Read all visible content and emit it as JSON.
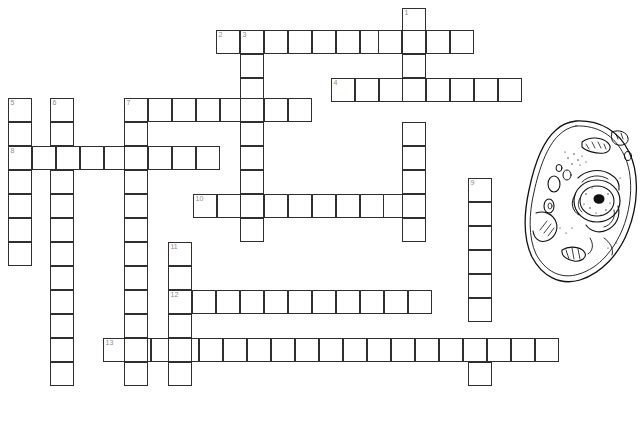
{
  "page": {
    "background_color": "#ffffff",
    "grid_line_color": "#2f2f2f",
    "number_color": "#8d8d8d",
    "cell_size_px": 24,
    "width_px": 643,
    "height_px": 422
  },
  "illustration": {
    "name": "animal-cell-diagram",
    "caption": "",
    "description": "Black and white line drawing of an animal cell showing nucleus, nucleolus, golgi apparatus, mitochondria, vacuoles and cytoplasm",
    "x": 520,
    "y": 118,
    "width": 120,
    "height": 170
  },
  "puzzle": {
    "numbers_visible": [
      "1",
      "2",
      "3",
      "4",
      "5",
      "6",
      "7",
      "8",
      "9",
      "10",
      "11",
      "12",
      "13"
    ],
    "entries": [
      {
        "number": "1",
        "direction": "down",
        "x": 402,
        "y": 8,
        "length": 10,
        "label": "1"
      },
      {
        "number": "2",
        "direction": "across",
        "x": 216,
        "y": 30,
        "length": 11,
        "label": "2"
      },
      {
        "number": "3",
        "direction": "down",
        "x": 240,
        "y": 30,
        "length": 13,
        "label": "3"
      },
      {
        "number": "4",
        "direction": "across",
        "x": 331,
        "y": 78,
        "length": 8,
        "label": "4"
      },
      {
        "number": "5",
        "direction": "down",
        "x": 8,
        "y": 98,
        "length": 6,
        "label": "5"
      },
      {
        "number": "6",
        "direction": "down",
        "x": 50,
        "y": 98,
        "length": 12,
        "label": "6"
      },
      {
        "number": "7",
        "direction": "across",
        "x": 124,
        "y": 98,
        "length": 8,
        "label": "7"
      },
      {
        "number": "7d",
        "direction": "down",
        "x": 124,
        "y": 98,
        "length": 12,
        "label": ""
      },
      {
        "number": "8",
        "direction": "across",
        "x": 8,
        "y": 146,
        "length": 9,
        "label": "8"
      },
      {
        "number": "9",
        "direction": "down",
        "x": 468,
        "y": 178,
        "length": 9,
        "label": "9"
      },
      {
        "number": "10",
        "direction": "across",
        "x": 193,
        "y": 194,
        "length": 10,
        "label": "10"
      },
      {
        "number": "11",
        "direction": "down",
        "x": 168,
        "y": 242,
        "length": 7,
        "label": "11"
      },
      {
        "number": "12",
        "direction": "across",
        "x": 168,
        "y": 290,
        "length": 11,
        "label": "12"
      },
      {
        "number": "13",
        "direction": "across",
        "x": 103,
        "y": 338,
        "length": 19,
        "label": "13"
      }
    ],
    "cells": [
      {
        "x": 402,
        "y": 8,
        "num": "1"
      },
      {
        "x": 216,
        "y": 30,
        "num": "2"
      },
      {
        "x": 240,
        "y": 30,
        "num": "3"
      },
      {
        "x": 264,
        "y": 30,
        "num": ""
      },
      {
        "x": 288,
        "y": 30,
        "num": ""
      },
      {
        "x": 312,
        "y": 30,
        "num": ""
      },
      {
        "x": 336,
        "y": 30,
        "num": ""
      },
      {
        "x": 360,
        "y": 30,
        "num": ""
      },
      {
        "x": 378,
        "y": 30,
        "num": ""
      },
      {
        "x": 402,
        "y": 30,
        "num": ""
      },
      {
        "x": 426,
        "y": 30,
        "num": ""
      },
      {
        "x": 450,
        "y": 30,
        "num": ""
      },
      {
        "x": 240,
        "y": 54,
        "num": ""
      },
      {
        "x": 402,
        "y": 54,
        "num": ""
      },
      {
        "x": 240,
        "y": 78,
        "num": ""
      },
      {
        "x": 331,
        "y": 78,
        "num": "4"
      },
      {
        "x": 355,
        "y": 78,
        "num": ""
      },
      {
        "x": 379,
        "y": 78,
        "num": ""
      },
      {
        "x": 402,
        "y": 78,
        "num": ""
      },
      {
        "x": 426,
        "y": 78,
        "num": ""
      },
      {
        "x": 450,
        "y": 78,
        "num": ""
      },
      {
        "x": 474,
        "y": 78,
        "num": ""
      },
      {
        "x": 498,
        "y": 78,
        "num": ""
      },
      {
        "x": 8,
        "y": 98,
        "num": "5"
      },
      {
        "x": 50,
        "y": 98,
        "num": "6"
      },
      {
        "x": 124,
        "y": 98,
        "num": "7"
      },
      {
        "x": 148,
        "y": 98,
        "num": ""
      },
      {
        "x": 172,
        "y": 98,
        "num": ""
      },
      {
        "x": 196,
        "y": 98,
        "num": ""
      },
      {
        "x": 220,
        "y": 98,
        "num": ""
      },
      {
        "x": 240,
        "y": 98,
        "num": ""
      },
      {
        "x": 264,
        "y": 98,
        "num": ""
      },
      {
        "x": 288,
        "y": 98,
        "num": ""
      },
      {
        "x": 8,
        "y": 122,
        "num": ""
      },
      {
        "x": 50,
        "y": 122,
        "num": ""
      },
      {
        "x": 124,
        "y": 122,
        "num": ""
      },
      {
        "x": 240,
        "y": 122,
        "num": ""
      },
      {
        "x": 402,
        "y": 122,
        "num": ""
      },
      {
        "x": 8,
        "y": 146,
        "num": "8"
      },
      {
        "x": 32,
        "y": 146,
        "num": ""
      },
      {
        "x": 56,
        "y": 146,
        "num": ""
      },
      {
        "x": 80,
        "y": 146,
        "num": ""
      },
      {
        "x": 104,
        "y": 146,
        "num": ""
      },
      {
        "x": 124,
        "y": 146,
        "num": ""
      },
      {
        "x": 148,
        "y": 146,
        "num": ""
      },
      {
        "x": 172,
        "y": 146,
        "num": ""
      },
      {
        "x": 196,
        "y": 146,
        "num": ""
      },
      {
        "x": 240,
        "y": 146,
        "num": ""
      },
      {
        "x": 402,
        "y": 146,
        "num": ""
      },
      {
        "x": 8,
        "y": 170,
        "num": ""
      },
      {
        "x": 50,
        "y": 170,
        "num": ""
      },
      {
        "x": 124,
        "y": 170,
        "num": ""
      },
      {
        "x": 240,
        "y": 170,
        "num": ""
      },
      {
        "x": 402,
        "y": 170,
        "num": ""
      },
      {
        "x": 468,
        "y": 178,
        "num": "9"
      },
      {
        "x": 8,
        "y": 194,
        "num": ""
      },
      {
        "x": 50,
        "y": 194,
        "num": ""
      },
      {
        "x": 124,
        "y": 194,
        "num": ""
      },
      {
        "x": 193,
        "y": 194,
        "num": "10"
      },
      {
        "x": 217,
        "y": 194,
        "num": ""
      },
      {
        "x": 240,
        "y": 194,
        "num": ""
      },
      {
        "x": 264,
        "y": 194,
        "num": ""
      },
      {
        "x": 288,
        "y": 194,
        "num": ""
      },
      {
        "x": 312,
        "y": 194,
        "num": ""
      },
      {
        "x": 336,
        "y": 194,
        "num": ""
      },
      {
        "x": 360,
        "y": 194,
        "num": ""
      },
      {
        "x": 383,
        "y": 194,
        "num": ""
      },
      {
        "x": 402,
        "y": 194,
        "num": ""
      },
      {
        "x": 8,
        "y": 218,
        "num": ""
      },
      {
        "x": 50,
        "y": 218,
        "num": ""
      },
      {
        "x": 124,
        "y": 218,
        "num": ""
      },
      {
        "x": 240,
        "y": 218,
        "num": ""
      },
      {
        "x": 402,
        "y": 218,
        "num": ""
      },
      {
        "x": 468,
        "y": 202,
        "num": ""
      },
      {
        "x": 8,
        "y": 242,
        "num": ""
      },
      {
        "x": 50,
        "y": 242,
        "num": ""
      },
      {
        "x": 124,
        "y": 242,
        "num": ""
      },
      {
        "x": 168,
        "y": 242,
        "num": "11"
      },
      {
        "x": 468,
        "y": 226,
        "num": ""
      },
      {
        "x": 50,
        "y": 266,
        "num": ""
      },
      {
        "x": 124,
        "y": 266,
        "num": ""
      },
      {
        "x": 168,
        "y": 266,
        "num": ""
      },
      {
        "x": 468,
        "y": 250,
        "num": ""
      },
      {
        "x": 50,
        "y": 290,
        "num": ""
      },
      {
        "x": 124,
        "y": 290,
        "num": ""
      },
      {
        "x": 168,
        "y": 290,
        "num": "12"
      },
      {
        "x": 192,
        "y": 290,
        "num": ""
      },
      {
        "x": 216,
        "y": 290,
        "num": ""
      },
      {
        "x": 240,
        "y": 290,
        "num": ""
      },
      {
        "x": 264,
        "y": 290,
        "num": ""
      },
      {
        "x": 288,
        "y": 290,
        "num": ""
      },
      {
        "x": 312,
        "y": 290,
        "num": ""
      },
      {
        "x": 336,
        "y": 290,
        "num": ""
      },
      {
        "x": 360,
        "y": 290,
        "num": ""
      },
      {
        "x": 384,
        "y": 290,
        "num": ""
      },
      {
        "x": 408,
        "y": 290,
        "num": ""
      },
      {
        "x": 468,
        "y": 274,
        "num": ""
      },
      {
        "x": 50,
        "y": 314,
        "num": ""
      },
      {
        "x": 124,
        "y": 314,
        "num": ""
      },
      {
        "x": 168,
        "y": 314,
        "num": ""
      },
      {
        "x": 468,
        "y": 298,
        "num": ""
      },
      {
        "x": 103,
        "y": 338,
        "num": "13"
      },
      {
        "x": 127,
        "y": 338,
        "num": ""
      },
      {
        "x": 151,
        "y": 338,
        "num": ""
      },
      {
        "x": 175,
        "y": 338,
        "num": ""
      },
      {
        "x": 199,
        "y": 338,
        "num": ""
      },
      {
        "x": 223,
        "y": 338,
        "num": ""
      },
      {
        "x": 247,
        "y": 338,
        "num": ""
      },
      {
        "x": 271,
        "y": 338,
        "num": ""
      },
      {
        "x": 295,
        "y": 338,
        "num": ""
      },
      {
        "x": 319,
        "y": 338,
        "num": ""
      },
      {
        "x": 343,
        "y": 338,
        "num": ""
      },
      {
        "x": 367,
        "y": 338,
        "num": ""
      },
      {
        "x": 391,
        "y": 338,
        "num": ""
      },
      {
        "x": 415,
        "y": 338,
        "num": ""
      },
      {
        "x": 439,
        "y": 338,
        "num": ""
      },
      {
        "x": 463,
        "y": 338,
        "num": ""
      },
      {
        "x": 487,
        "y": 338,
        "num": ""
      },
      {
        "x": 511,
        "y": 338,
        "num": ""
      },
      {
        "x": 535,
        "y": 338,
        "num": ""
      },
      {
        "x": 50,
        "y": 338,
        "num": ""
      },
      {
        "x": 124,
        "y": 338,
        "num": ""
      },
      {
        "x": 168,
        "y": 338,
        "num": ""
      },
      {
        "x": 50,
        "y": 362,
        "num": ""
      },
      {
        "x": 124,
        "y": 362,
        "num": ""
      },
      {
        "x": 168,
        "y": 362,
        "num": ""
      },
      {
        "x": 468,
        "y": 362,
        "num": ""
      }
    ]
  }
}
